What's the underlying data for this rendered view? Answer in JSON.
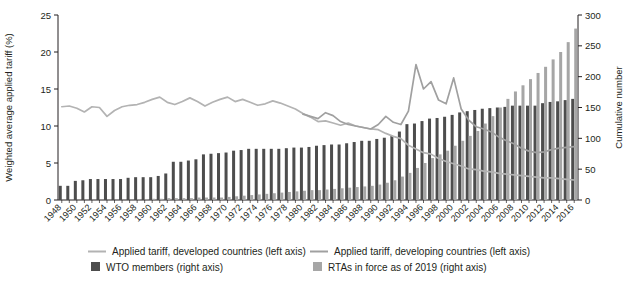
{
  "chart_data": {
    "type": "bar",
    "title": "",
    "xlabel": "",
    "ylabel": "Weighted average applied tariff (%)",
    "y2label": "Cumulative number",
    "ylim": [
      0,
      25
    ],
    "y2lim": [
      0,
      300
    ],
    "yticks": [
      "0",
      "5",
      "10",
      "15",
      "20",
      "25"
    ],
    "y2ticks": [
      "0",
      "50",
      "100",
      "150",
      "200",
      "250",
      "300"
    ],
    "grid": false,
    "legend_position": "bottom",
    "x": [
      1948,
      1949,
      1950,
      1951,
      1952,
      1953,
      1954,
      1955,
      1956,
      1957,
      1958,
      1959,
      1960,
      1961,
      1962,
      1963,
      1964,
      1965,
      1966,
      1967,
      1968,
      1969,
      1970,
      1971,
      1972,
      1973,
      1974,
      1975,
      1976,
      1977,
      1978,
      1979,
      1980,
      1981,
      1982,
      1983,
      1984,
      1985,
      1986,
      1987,
      1988,
      1989,
      1990,
      1991,
      1992,
      1993,
      1994,
      1995,
      1996,
      1997,
      1998,
      1999,
      2000,
      2001,
      2002,
      2003,
      2004,
      2005,
      2006,
      2007,
      2008,
      2009,
      2010,
      2011,
      2012,
      2013,
      2014,
      2015,
      2016
    ],
    "xtick_labels": [
      "1948",
      "1950",
      "1952",
      "1954",
      "1956",
      "1958",
      "1960",
      "1962",
      "1964",
      "1966",
      "1968",
      "1970",
      "1972",
      "1974",
      "1976",
      "1978",
      "1980",
      "1982",
      "1984",
      "1986",
      "1988",
      "1990",
      "1992",
      "1994",
      "1996",
      "1998",
      "2000",
      "2002",
      "2004",
      "2006",
      "2008",
      "2010",
      "2012",
      "2014",
      "2016"
    ],
    "series": [
      {
        "name": "WTO members (right axis)",
        "type": "bar",
        "axis": "right",
        "color": "#4d4d4d",
        "values": [
          23,
          23,
          31,
          32,
          34,
          34,
          34,
          34,
          34,
          36,
          37,
          37,
          37,
          39,
          43,
          62,
          62,
          64,
          66,
          74,
          75,
          76,
          77,
          80,
          81,
          83,
          83,
          83,
          83,
          83,
          84,
          85,
          85,
          86,
          88,
          89,
          90,
          90,
          92,
          94,
          96,
          96,
          99,
          101,
          104,
          111,
          123,
          124,
          128,
          132,
          133,
          135,
          138,
          142,
          144,
          146,
          148,
          149,
          150,
          151,
          153,
          153,
          153,
          153,
          157,
          159,
          160,
          162,
          164
        ]
      },
      {
        "name": "RTAs in force as of 2019 (right axis)",
        "type": "bar",
        "axis": "right",
        "color": "#a6a6a6",
        "values": [
          0,
          0,
          0,
          0,
          0,
          0,
          0,
          0,
          0,
          0,
          1,
          1,
          2,
          2,
          3,
          3,
          3,
          3,
          4,
          4,
          4,
          4,
          5,
          6,
          7,
          8,
          9,
          10,
          11,
          12,
          13,
          14,
          15,
          16,
          16,
          17,
          18,
          19,
          20,
          21,
          22,
          23,
          25,
          28,
          32,
          38,
          44,
          52,
          60,
          68,
          74,
          80,
          88,
          96,
          104,
          112,
          124,
          136,
          150,
          164,
          176,
          186,
          196,
          206,
          216,
          228,
          240,
          256,
          278
        ]
      },
      {
        "name": "Applied tariff, developed countries (left axis)",
        "type": "line",
        "axis": "left",
        "color": "#b3b3b3",
        "values": [
          12.6,
          12.7,
          12.4,
          11.9,
          12.6,
          12.5,
          11.3,
          12.1,
          12.6,
          12.8,
          12.9,
          13.2,
          13.6,
          13.9,
          13.2,
          12.9,
          13.3,
          13.8,
          13.3,
          12.7,
          13.2,
          13.6,
          13.9,
          13.3,
          13.6,
          13.2,
          12.8,
          13.0,
          13.4,
          13.1,
          12.7,
          12.3,
          11.7,
          11.2,
          10.6,
          10.7,
          10.4,
          10.1,
          10.4,
          10.0,
          9.8,
          9.6,
          9.5,
          9.0,
          8.6,
          8.3,
          7.4,
          6.9,
          6.4,
          6.2,
          5.6,
          5.2,
          4.9,
          4.6,
          4.2,
          4.1,
          3.9,
          3.8,
          3.6,
          3.5,
          3.4,
          3.3,
          3.2,
          3.1,
          3.0,
          3.0,
          2.9,
          2.8,
          2.7
        ]
      },
      {
        "name": "Applied tariff, developing countries (left axis)",
        "type": "line",
        "axis": "left",
        "color": "#a0a0a0",
        "values": [
          null,
          null,
          null,
          null,
          null,
          null,
          null,
          null,
          null,
          null,
          null,
          null,
          null,
          null,
          null,
          null,
          null,
          null,
          null,
          null,
          null,
          null,
          null,
          null,
          null,
          null,
          null,
          null,
          null,
          null,
          null,
          null,
          11.6,
          11.3,
          11.0,
          11.8,
          11.4,
          10.6,
          10.2,
          10.0,
          9.8,
          9.6,
          10.2,
          11.3,
          10.5,
          10.2,
          12.0,
          18.3,
          15.0,
          16.0,
          13.5,
          13.0,
          16.5,
          12.3,
          10.8,
          9.9,
          9.6,
          9.2,
          8.5,
          8.0,
          7.6,
          7.0,
          6.6,
          6.4,
          6.5,
          6.8,
          7.0,
          7.1,
          7.2
        ]
      }
    ],
    "legend": [
      {
        "label": "Applied tariff, developed countries (left axis)",
        "marker": "line",
        "color": "#b3b3b3"
      },
      {
        "label": "Applied tariff, developing countries (left axis)",
        "marker": "line",
        "color": "#a0a0a0"
      },
      {
        "label": "WTO members (right axis)",
        "marker": "square",
        "color": "#4d4d4d"
      },
      {
        "label": "RTAs in force as of 2019 (right axis)",
        "marker": "square",
        "color": "#a6a6a6"
      }
    ]
  }
}
